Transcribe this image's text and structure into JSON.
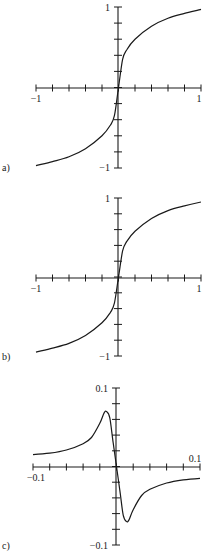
{
  "chart_data": [
    {
      "type": "line",
      "panel_label": "a)",
      "title": "",
      "xlabel": "",
      "ylabel": "",
      "xlim": [
        -1,
        1
      ],
      "ylim": [
        -1,
        1
      ],
      "x_tick_labels": [
        "-1",
        "1"
      ],
      "y_tick_labels": [
        "1",
        "-1"
      ],
      "x_ticks_count": 11,
      "y_ticks_count": 11,
      "grid": false,
      "description": "odd monotonic sigmoid-like curve, steep near origin, approaching about ±0.95 at x=±1",
      "x": [
        -1,
        -0.8,
        -0.6,
        -0.4,
        -0.2,
        -0.1,
        -0.05,
        0,
        0.05,
        0.1,
        0.2,
        0.4,
        0.6,
        0.8,
        1
      ],
      "y": [
        -0.97,
        -0.92,
        -0.86,
        -0.76,
        -0.6,
        -0.47,
        -0.35,
        0,
        0.35,
        0.47,
        0.6,
        0.76,
        0.86,
        0.92,
        0.97
      ]
    },
    {
      "type": "line",
      "panel_label": "b)",
      "title": "",
      "xlabel": "",
      "ylabel": "",
      "xlim": [
        -1,
        1
      ],
      "ylim": [
        -1,
        1
      ],
      "x_tick_labels": [
        "-1",
        "1"
      ],
      "y_tick_labels": [
        "1",
        "-1"
      ],
      "x_ticks_count": 11,
      "y_ticks_count": 11,
      "grid": false,
      "description": "odd monotonic curve nearly identical to (a)",
      "x": [
        -1,
        -0.8,
        -0.6,
        -0.4,
        -0.2,
        -0.1,
        -0.05,
        0,
        0.05,
        0.1,
        0.2,
        0.4,
        0.6,
        0.8,
        1
      ],
      "y": [
        -0.95,
        -0.9,
        -0.84,
        -0.74,
        -0.58,
        -0.45,
        -0.33,
        0,
        0.33,
        0.45,
        0.58,
        0.74,
        0.84,
        0.9,
        0.95
      ]
    },
    {
      "type": "line",
      "panel_label": "c)",
      "title": "",
      "xlabel": "",
      "ylabel": "",
      "xlim": [
        -0.1,
        0.1
      ],
      "ylim": [
        -0.1,
        0.1
      ],
      "x_tick_labels": [
        "-0.1",
        "0.1"
      ],
      "y_tick_labels": [
        "0.1",
        "-0.1"
      ],
      "x_ticks_count": 11,
      "y_ticks_count": 11,
      "grid": false,
      "description": "difference curve: odd function with positive peak ~0.07 near x=-0.012 and negative trough ~-0.07 near x=0.012, tails ~±0.015",
      "x": [
        -0.1,
        -0.08,
        -0.06,
        -0.04,
        -0.03,
        -0.02,
        -0.015,
        -0.012,
        -0.008,
        -0.004,
        0,
        0.004,
        0.008,
        0.012,
        0.015,
        0.02,
        0.03,
        0.04,
        0.06,
        0.08,
        0.1
      ],
      "y": [
        0.015,
        0.017,
        0.021,
        0.029,
        0.037,
        0.055,
        0.068,
        0.07,
        0.062,
        0.03,
        0,
        -0.03,
        -0.062,
        -0.07,
        -0.068,
        -0.055,
        -0.037,
        -0.029,
        -0.021,
        -0.017,
        -0.015
      ]
    }
  ],
  "panels": [
    {
      "label": "a)",
      "x_min_label": "−1",
      "x_max_label": "1",
      "y_max_label": "1",
      "y_min_label": "−1"
    },
    {
      "label": "b)",
      "x_min_label": "−1",
      "x_max_label": "1",
      "y_max_label": "1",
      "y_min_label": "−1"
    },
    {
      "label": "c)",
      "x_min_label": "−0.1",
      "x_max_label": "0.1",
      "y_max_label": "0.1",
      "y_min_label": "−0.1"
    }
  ],
  "colors": {
    "ink": "#1a1a1a",
    "background": "#ffffff"
  }
}
